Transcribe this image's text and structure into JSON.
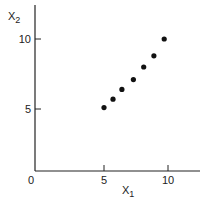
{
  "chart_data": {
    "type": "scatter",
    "title": "",
    "xlabel": "X1",
    "ylabel": "X2",
    "x": [
      5.0,
      5.7,
      6.4,
      7.3,
      8.1,
      8.9,
      9.7
    ],
    "y": [
      5.1,
      5.7,
      6.4,
      7.1,
      8.0,
      8.8,
      10.0
    ],
    "x_ticks": [
      0,
      5,
      10
    ],
    "y_ticks": [
      5,
      10
    ],
    "xlim": [
      0,
      12.5
    ],
    "ylim": [
      0,
      12.3
    ],
    "grid": false,
    "legend": null
  },
  "labels": {
    "x_axis": "X",
    "x_axis_sub": "1",
    "y_axis": "X",
    "y_axis_sub": "2",
    "tick_x_0": "0",
    "tick_x_5": "5",
    "tick_x_10": "10",
    "tick_y_5": "5",
    "tick_y_10": "10"
  },
  "colors": {
    "axis": "#222222",
    "points": "#111111"
  }
}
